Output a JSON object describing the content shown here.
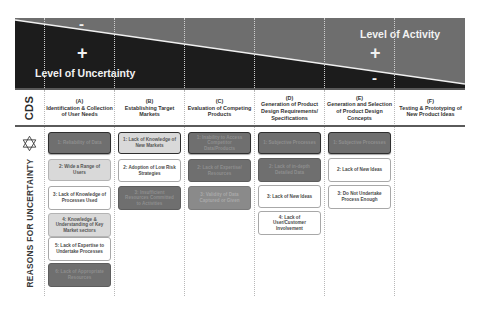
{
  "banner": {
    "uncertainty_label": "Level of Uncertainty",
    "activity_label": "Level of Activity",
    "uncertainty_top_sign": "-",
    "uncertainty_bottom_sign": "+",
    "activity_top_sign": "+",
    "activity_bottom_sign": "-",
    "colors": {
      "uncertainty_fill": "#1c1c1c",
      "activity_fill": "#6e6e6e",
      "divider": "#f0f0f0"
    }
  },
  "row_labels": {
    "header": "CDS",
    "body": "REASONS FOR UNCERTAINTY",
    "body_icon": "star-of-david-icon"
  },
  "columns": [
    {
      "letter": "(A)",
      "title": "Identification & Collection of User Needs",
      "items": [
        {
          "text": "1: Reliability of Data",
          "style": "dark emph"
        },
        {
          "text": "2: Wide a Range of Users",
          "style": "light"
        },
        {
          "text": "3: Lack of Knowledge of Processes Used",
          "style": "white"
        },
        {
          "text": "4: Knowledge & Understanding of Key Market sectors",
          "style": "light"
        },
        {
          "text": "5: Lack of Expertise to Undertake Processes",
          "style": "white"
        },
        {
          "text": "6: Lack of Appropriate Resources",
          "style": "dark"
        }
      ]
    },
    {
      "letter": "(B)",
      "title": "Establishing Target Markets",
      "items": [
        {
          "text": "1: Lack of Knowledge of New Markets",
          "style": "light emph"
        },
        {
          "text": "2: Adoption of Low Risk Strategies",
          "style": "white"
        },
        {
          "text": "3: Insufficient Resources Committed to Activities",
          "style": "dark"
        }
      ]
    },
    {
      "letter": "(C)",
      "title": "Evaluation of Competing Products",
      "items": [
        {
          "text": "1: Inability to Access Competitor Data/Products",
          "style": "dark emph"
        },
        {
          "text": "2: Lack of Expertise/ Resources",
          "style": "dark"
        },
        {
          "text": "3: Validity of Data Captured or Given",
          "style": "mid"
        }
      ]
    },
    {
      "letter": "(D)",
      "title": "Generation of Product Design Requirements/ Specifications",
      "items": [
        {
          "text": "1: Subjective Processes",
          "style": "dark emph"
        },
        {
          "text": "2: Lack of in-depth Detailed Data",
          "style": "dark"
        },
        {
          "text": "3: Lack of New Ideas",
          "style": "white"
        },
        {
          "text": "4: Lack of User/Customer Involvement",
          "style": "white"
        }
      ]
    },
    {
      "letter": "(E)",
      "title": "Generation and Selection of Product Design Concepts",
      "items": [
        {
          "text": "1: Subjective Processes",
          "style": "dark emph"
        },
        {
          "text": "2: Lack of New Ideas",
          "style": "white"
        },
        {
          "text": "3: Do Not Undertake Process Enough",
          "style": "white"
        }
      ]
    },
    {
      "letter": "(F)",
      "title": "Testing & Prototyping of New Product Ideas",
      "items": []
    }
  ]
}
